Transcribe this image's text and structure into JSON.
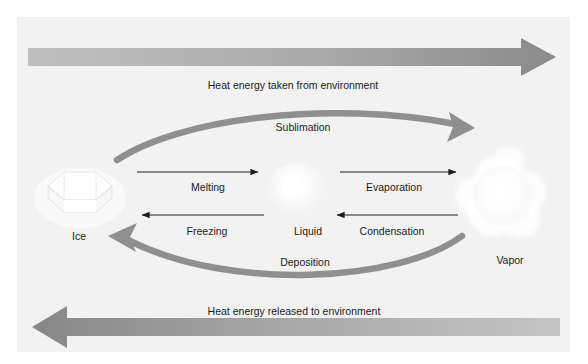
{
  "diagram": {
    "background_color": "#f2f2f2",
    "page_color": "#ffffff",
    "text_color": "#1c1c1c",
    "thick_arrow_color_light": "#b4b4b4",
    "thick_arrow_color_dark": "#8a8a8a",
    "curve_arrow_color": "#8f8f8f",
    "thin_arrow_color": "#1c1c1c"
  },
  "energy_arrows": {
    "top": {
      "label": "Heat energy taken from environment",
      "direction": "right",
      "icon": "thick-right-arrow-icon"
    },
    "bottom": {
      "label": "Heat energy released to environment",
      "direction": "left",
      "icon": "thick-left-arrow-icon"
    }
  },
  "states": [
    {
      "id": "ice",
      "label": "Ice",
      "icon": "ice-crystal-icon"
    },
    {
      "id": "liquid",
      "label": "Liquid",
      "icon": "water-droplet-icon"
    },
    {
      "id": "vapor",
      "label": "Vapor",
      "icon": "vapor-cloud-icon"
    }
  ],
  "transitions": [
    {
      "id": "melting",
      "label": "Melting",
      "from": "ice",
      "to": "liquid",
      "direction": "right",
      "style": "thin"
    },
    {
      "id": "evaporation",
      "label": "Evaporation",
      "from": "liquid",
      "to": "vapor",
      "direction": "right",
      "style": "thin"
    },
    {
      "id": "freezing",
      "label": "Freezing",
      "from": "liquid",
      "to": "ice",
      "direction": "left",
      "style": "thin"
    },
    {
      "id": "condensation",
      "label": "Condensation",
      "from": "vapor",
      "to": "liquid",
      "direction": "left",
      "style": "thin"
    },
    {
      "id": "sublimation",
      "label": "Sublimation",
      "from": "ice",
      "to": "vapor",
      "direction": "right",
      "style": "thick-curve-top"
    },
    {
      "id": "deposition",
      "label": "Deposition",
      "from": "vapor",
      "to": "ice",
      "direction": "left",
      "style": "thick-curve-bottom"
    }
  ]
}
